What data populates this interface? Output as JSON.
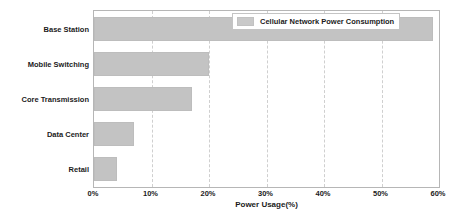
{
  "chart_data": {
    "type": "bar",
    "orientation": "horizontal",
    "title": "",
    "xlabel": "Power Usage(%)",
    "ylabel": "",
    "categories": [
      "Base Station",
      "Mobile Switching",
      "Core Transmission",
      "Data Center",
      "Retail"
    ],
    "values": [
      59,
      20,
      17,
      7,
      4
    ],
    "series": [
      {
        "name": "Cellular Network Power Consumption",
        "values": [
          59,
          20,
          17,
          7,
          4
        ]
      }
    ],
    "xlim": [
      0,
      60
    ],
    "xticks": [
      0,
      10,
      20,
      30,
      40,
      50,
      60
    ],
    "xtick_labels": [
      "0%",
      "10%",
      "20%",
      "30%",
      "40%",
      "50%",
      "60%"
    ],
    "grid": true,
    "grid_axis": "x",
    "grid_style": "dashed",
    "legend": {
      "position": "top-right",
      "entries": [
        "Cellular Network Power Consumption"
      ]
    },
    "colors": {
      "bar_fill": "#c3c3c3",
      "bar_edge": "#bdbdbd",
      "legend_swatch": "#c9c9c9",
      "gridline": "#cfcfcf",
      "frame": "#b6b6b6",
      "text": "#1b1b1b",
      "background": "#ffffff"
    }
  }
}
